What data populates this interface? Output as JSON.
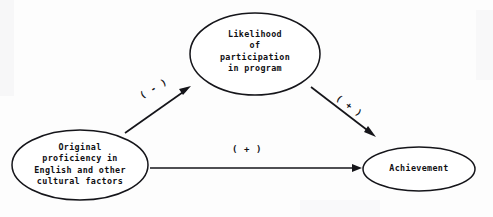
{
  "diagram": {
    "type": "path-model-diagram",
    "background_color": "#fdfdfd",
    "stroke_color": "#15151a",
    "nodes": [
      {
        "id": "likelihood",
        "shape": "ellipse",
        "label": "Likelihood\nof\nparticipation\nin program",
        "cx": 255,
        "cy": 54,
        "rx": 65,
        "ry": 41
      },
      {
        "id": "original-proficiency",
        "shape": "ellipse",
        "label": "Original\nproficiency in\nEnglish and other\ncultural factors",
        "cx": 80,
        "cy": 165,
        "rx": 68,
        "ry": 35
      },
      {
        "id": "achievement",
        "shape": "ellipse",
        "label": "Achievement",
        "cx": 419,
        "cy": 169,
        "rx": 56,
        "ry": 22
      }
    ],
    "edges": [
      {
        "id": "proficiency-to-likelihood",
        "from": "original-proficiency",
        "to": "likelihood",
        "sign_label": "( - )",
        "direction": "up-right"
      },
      {
        "id": "likelihood-to-achievement",
        "from": "likelihood",
        "to": "achievement",
        "sign_label": "( + )",
        "direction": "down-right"
      },
      {
        "id": "proficiency-to-achievement",
        "from": "original-proficiency",
        "to": "achievement",
        "sign_label": "( + )",
        "direction": "right"
      }
    ]
  }
}
